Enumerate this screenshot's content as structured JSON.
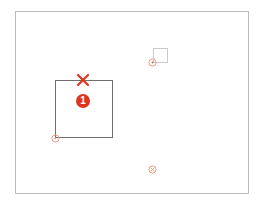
{
  "colors": {
    "frame": "#b9b9b9",
    "big_square": "#6e6e6e",
    "small_square": "#c9c9c9",
    "accent_red": "#e0341e",
    "marker": "#ec9c80"
  },
  "badge": {
    "label": "1"
  },
  "icons": {
    "close": "close-x-icon",
    "marker": "crosshair-target-icon"
  },
  "markers": [
    {
      "id": "marker-bottom-left-of-square",
      "x": 55,
      "y": 138
    },
    {
      "id": "marker-near-small-square",
      "x": 152,
      "y": 62
    },
    {
      "id": "marker-bottom-center",
      "x": 152,
      "y": 169
    }
  ]
}
